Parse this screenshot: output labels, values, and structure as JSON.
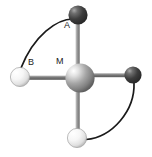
{
  "figure": {
    "type": "molecular-geometry-diagram",
    "background_color": "#ffffff",
    "width": 152,
    "height": 157
  },
  "labels": {
    "center": "M",
    "ligand_top": "A",
    "ligand_left": "B"
  },
  "atoms": [
    {
      "id": "M",
      "label": "M",
      "role": "central-metal-atom",
      "cx": 80,
      "cy": 78,
      "r": 14.5,
      "color_light": "#f2f2f2",
      "color_mid": "#9a9a9a",
      "color_dark": "#6f6f6f",
      "highlight_x": 73,
      "highlight_y": 69
    },
    {
      "id": "A",
      "label": "A",
      "role": "ligand-top-dark",
      "cx": 78,
      "cy": 15,
      "r": 9.5,
      "color_light": "#8c8c8c",
      "color_mid": "#454545",
      "color_dark": "#2b2b2b",
      "highlight_x": 74,
      "highlight_y": 10
    },
    {
      "id": "B",
      "label": "B",
      "role": "ligand-left-white",
      "cx": 20,
      "cy": 77,
      "r": 9.5,
      "color_light": "#ffffff",
      "color_mid": "#ebebeb",
      "color_dark": "#b5b5b5",
      "highlight_x": 16,
      "highlight_y": 72
    },
    {
      "id": "R",
      "label": "",
      "role": "ligand-right-dark",
      "cx": 133,
      "cy": 75,
      "r": 8.5,
      "color_light": "#858585",
      "color_mid": "#454545",
      "color_dark": "#2b2b2b",
      "highlight_x": 129,
      "highlight_y": 70
    },
    {
      "id": "D",
      "label": "",
      "role": "ligand-bottom-white",
      "cx": 77,
      "cy": 138,
      "r": 9.5,
      "color_light": "#ffffff",
      "color_mid": "#ebebeb",
      "color_dark": "#b5b5b5",
      "highlight_x": 73,
      "highlight_y": 133
    }
  ],
  "bonds": [
    {
      "id": "bond-M-A",
      "from": "M",
      "to": "A",
      "orientation": "vertical-up",
      "color": "#8e8e8e"
    },
    {
      "id": "bond-M-B",
      "from": "M",
      "to": "B",
      "orientation": "horizontal-left",
      "color": "#6a6a6a"
    },
    {
      "id": "bond-M-R",
      "from": "M",
      "to": "R",
      "orientation": "horizontal-right",
      "color": "#6a6a6a"
    },
    {
      "id": "bond-M-D",
      "from": "M",
      "to": "D",
      "orientation": "vertical-down",
      "color": "#8e8e8e"
    }
  ],
  "arcs": [
    {
      "id": "arc-A-B",
      "from": "A",
      "to": "B",
      "path": "M 73,19 C 58,19 36,34 22,67",
      "color": "#1a1a1a",
      "width": 1.6
    },
    {
      "id": "arc-R-D",
      "from": "R",
      "to": "D",
      "path": "M 133,84 C 133,112 112,137 86,139",
      "color": "#1a1a1a",
      "width": 1.6
    }
  ],
  "colors": {
    "background": "#ffffff",
    "label_text": "#1a1a1a",
    "arc_stroke": "#1a1a1a",
    "bond_stroke": "#6a6a6a"
  }
}
